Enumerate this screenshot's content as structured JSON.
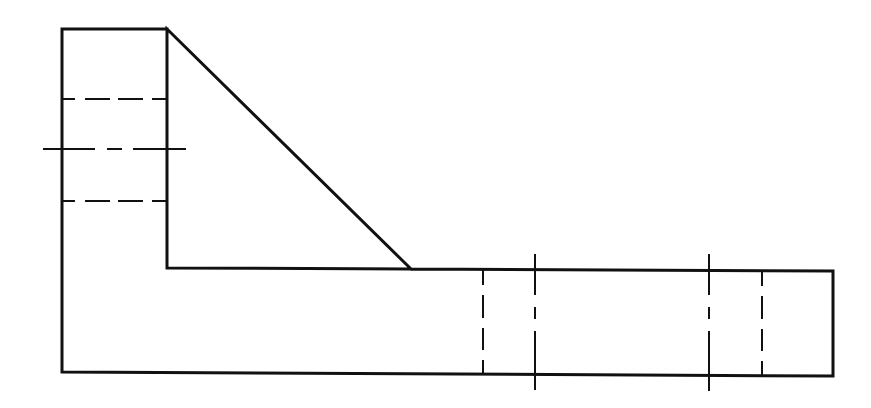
{
  "drawing": {
    "type": "orthographic-front-view",
    "colors": {
      "background": "#ffffff",
      "line": "#111111"
    },
    "outline_points": [
      [
        62,
        29
      ],
      [
        167,
        29
      ],
      [
        411,
        269
      ],
      [
        833,
        271
      ],
      [
        833,
        376
      ],
      [
        62,
        372
      ]
    ],
    "inner_step": {
      "vertical_x": 167,
      "from_y": 29,
      "to_y": 268,
      "horizontal_to_x": 411
    },
    "hidden_lines": [
      {
        "id": "upper-bore-edge",
        "orientation": "horizontal",
        "y": 99,
        "x1": 62,
        "x2": 167
      },
      {
        "id": "lower-bore-edge",
        "orientation": "horizontal",
        "y": 201,
        "x1": 62,
        "x2": 167
      },
      {
        "id": "left-hole-edge",
        "orientation": "vertical",
        "x": 483,
        "y1": 270,
        "y2": 375
      },
      {
        "id": "right-hole-edge",
        "orientation": "vertical",
        "x": 762,
        "y1": 271,
        "y2": 376
      }
    ],
    "center_lines": [
      {
        "id": "bore-centerline",
        "orientation": "horizontal",
        "y": 149,
        "x1": 43,
        "x2": 186
      },
      {
        "id": "hole1-centerline",
        "orientation": "vertical",
        "x": 535,
        "y1": 254,
        "y2": 390
      },
      {
        "id": "hole2-centerline",
        "orientation": "vertical",
        "x": 709,
        "y1": 254,
        "y2": 391
      }
    ]
  }
}
